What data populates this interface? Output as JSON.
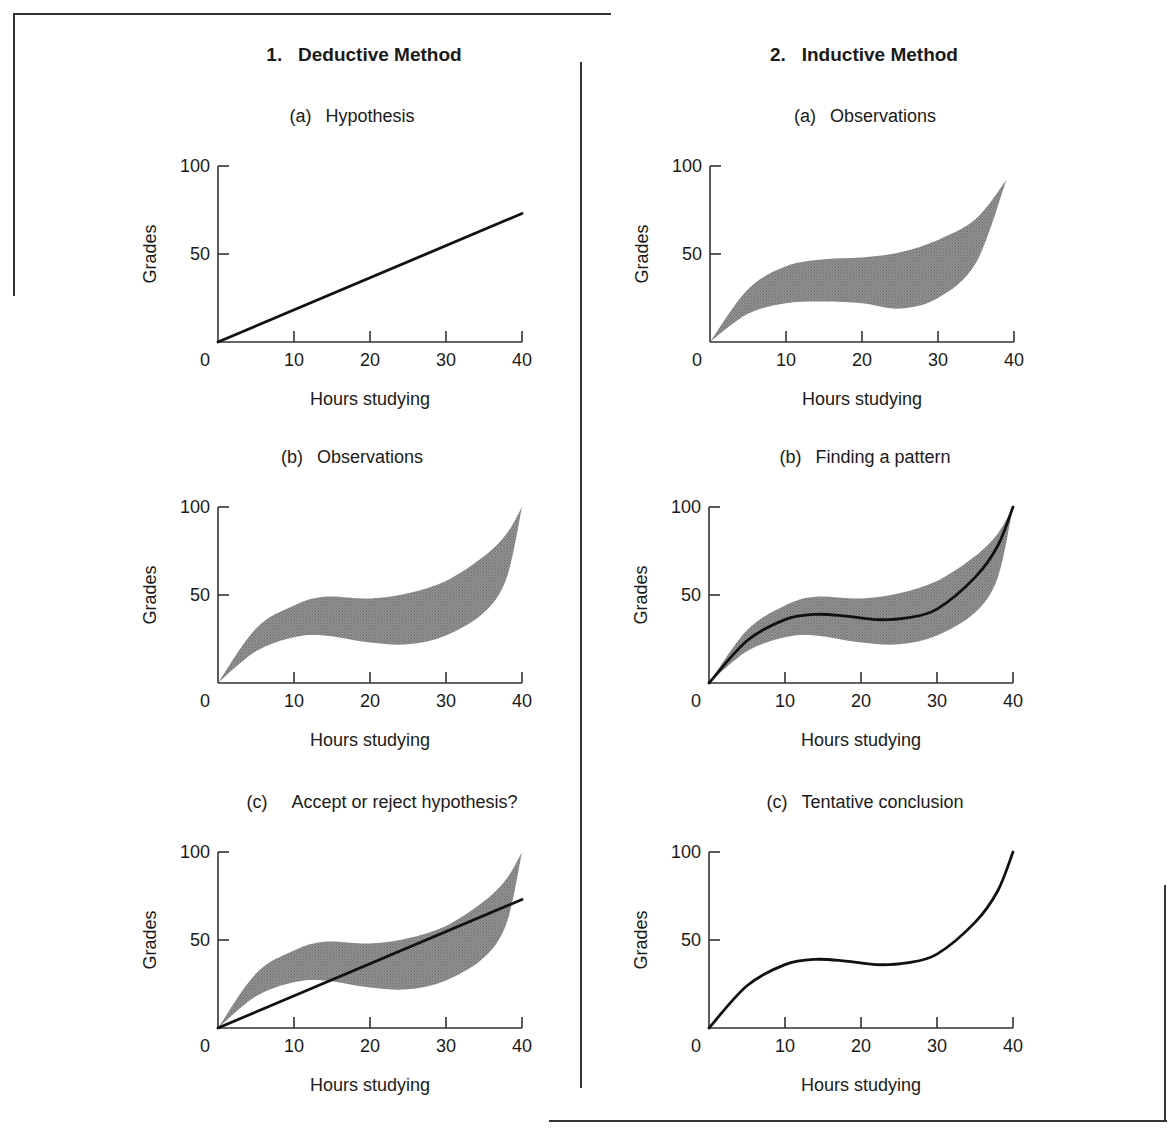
{
  "figure": {
    "top_caption_cut": "Deductive and Inductive Methods",
    "columns": [
      {
        "title": "1.   Deductive Method",
        "panels": [
          {
            "tag": "(a)",
            "title": "Hypothesis"
          },
          {
            "tag": "(b)",
            "title": "Observations"
          },
          {
            "tag": "(c)",
            "title": "Accept or reject hypothesis?"
          }
        ]
      },
      {
        "title": "2.   Inductive Method",
        "panels": [
          {
            "tag": "(a)",
            "title": "Observations"
          },
          {
            "tag": "(b)",
            "title": "Finding a pattern"
          },
          {
            "tag": "(c)",
            "title": "Tentative conclusion"
          }
        ]
      }
    ],
    "axes": {
      "xlabel": "Hours studying",
      "ylabel": "Grades",
      "xticks": [
        "0",
        "10",
        "20",
        "30",
        "40"
      ],
      "yticks": [
        "100",
        "50"
      ]
    },
    "colors": {
      "line": "#111111",
      "band": "#7d7d7d",
      "axis": "#333333"
    }
  },
  "chart_data": [
    {
      "type": "line",
      "panel": "1a",
      "title": "(a) Hypothesis",
      "xlabel": "Hours studying",
      "ylabel": "Grades",
      "xlim": [
        0,
        40
      ],
      "ylim": [
        0,
        100
      ],
      "series": [
        {
          "name": "hypothesis",
          "x": [
            0,
            40
          ],
          "y": [
            0,
            73
          ]
        }
      ]
    },
    {
      "type": "area",
      "panel": "1b",
      "title": "(b) Observations",
      "xlabel": "Hours studying",
      "ylabel": "Grades",
      "xlim": [
        0,
        40
      ],
      "ylim": [
        0,
        100
      ],
      "band": {
        "x": [
          0,
          5,
          10,
          14,
          20,
          25,
          30,
          35,
          38,
          40
        ],
        "upper": [
          0,
          31,
          44,
          49,
          48,
          51,
          58,
          72,
          85,
          100
        ],
        "lower": [
          0,
          18,
          26,
          27,
          23,
          22,
          27,
          40,
          60,
          100
        ]
      }
    },
    {
      "type": "area",
      "panel": "1c",
      "title": "(c) Accept or reject hypothesis?",
      "xlabel": "Hours studying",
      "ylabel": "Grades",
      "xlim": [
        0,
        40
      ],
      "ylim": [
        0,
        100
      ],
      "band": {
        "x": [
          0,
          5,
          10,
          14,
          20,
          25,
          30,
          35,
          38,
          40
        ],
        "upper": [
          0,
          31,
          44,
          49,
          48,
          51,
          58,
          72,
          85,
          100
        ],
        "lower": [
          0,
          18,
          26,
          27,
          23,
          22,
          27,
          40,
          60,
          100
        ]
      },
      "series": [
        {
          "name": "hypothesis",
          "x": [
            0,
            40
          ],
          "y": [
            0,
            73
          ]
        }
      ]
    },
    {
      "type": "area",
      "panel": "2a",
      "title": "(a) Observations",
      "xlabel": "Hours studying",
      "ylabel": "Grades",
      "xlim": [
        0,
        40
      ],
      "ylim": [
        0,
        100
      ],
      "band": {
        "x": [
          0,
          5,
          10,
          15,
          20,
          25,
          30,
          35,
          39
        ],
        "upper": [
          0,
          30,
          43,
          47,
          48,
          51,
          58,
          70,
          92
        ],
        "lower": [
          0,
          16,
          22,
          23,
          22,
          19,
          25,
          45,
          92
        ]
      }
    },
    {
      "type": "area",
      "panel": "2b",
      "title": "(b) Finding a pattern",
      "xlabel": "Hours studying",
      "ylabel": "Grades",
      "xlim": [
        0,
        40
      ],
      "ylim": [
        0,
        100
      ],
      "band": {
        "x": [
          0,
          5,
          10,
          14,
          20,
          25,
          30,
          35,
          38,
          40
        ],
        "upper": [
          0,
          30,
          44,
          49,
          48,
          51,
          58,
          72,
          85,
          100
        ],
        "lower": [
          0,
          18,
          26,
          27,
          23,
          22,
          27,
          40,
          60,
          100
        ]
      },
      "series": [
        {
          "name": "pattern",
          "x": [
            0,
            5,
            10,
            14,
            18,
            22,
            26,
            30,
            35,
            38,
            40
          ],
          "y": [
            0,
            24,
            36,
            39,
            38,
            36,
            37,
            42,
            60,
            78,
            100
          ]
        }
      ]
    },
    {
      "type": "line",
      "panel": "2c",
      "title": "(c) Tentative conclusion",
      "xlabel": "Hours studying",
      "ylabel": "Grades",
      "xlim": [
        0,
        40
      ],
      "ylim": [
        0,
        100
      ],
      "series": [
        {
          "name": "conclusion",
          "x": [
            0,
            5,
            10,
            14,
            18,
            22,
            26,
            30,
            35,
            38,
            40
          ],
          "y": [
            0,
            24,
            36,
            39,
            38,
            36,
            37,
            42,
            60,
            78,
            100
          ]
        }
      ]
    }
  ]
}
